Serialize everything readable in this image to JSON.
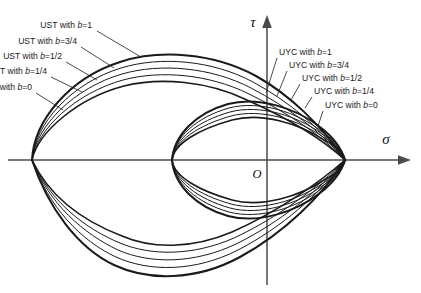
{
  "figure": {
    "background_color": "#ffffff",
    "curve_color": "#1a1a1a",
    "axis_color": "#4a4a4a",
    "leader_color": "#2b2b2b"
  },
  "axes": {
    "x_axis": {
      "label": "σ",
      "name": "sigma-axis",
      "arrow": "right"
    },
    "y_axis": {
      "label": "τ",
      "name": "tau-axis",
      "arrow": "up"
    },
    "origin": {
      "label": "O"
    }
  },
  "chart_data": {
    "type": "line",
    "title": "",
    "subtitle": "",
    "xlabel": "σ",
    "ylabel": "τ",
    "grid": false,
    "legend_position": "inline-callouts",
    "annotations": [
      "UST with b=0",
      "UST with b=1/4",
      "UST with b=1/2",
      "UST with b=3/4",
      "UST with b=1",
      "UYC with b=0",
      "UYC with b=1/4",
      "UYC with b=1/2",
      "UYC with b=3/4",
      "UYC with b=1"
    ],
    "series": [
      {
        "name": "UST with b=0",
        "family": "UST",
        "b": 0
      },
      {
        "name": "UST with b=1/4",
        "family": "UST",
        "b": 0.25
      },
      {
        "name": "UST with b=1/2",
        "family": "UST",
        "b": 0.5
      },
      {
        "name": "UST with b=3/4",
        "family": "UST",
        "b": 0.75
      },
      {
        "name": "UST with b=1",
        "family": "UST",
        "b": 1
      },
      {
        "name": "UYC with b=0",
        "family": "UYC",
        "b": 0
      },
      {
        "name": "UYC with b=1/4",
        "family": "UYC",
        "b": 0.25
      },
      {
        "name": "UYC with b=1/2",
        "family": "UYC",
        "b": 0.5
      },
      {
        "name": "UYC with b=3/4",
        "family": "UYC",
        "b": 0.75
      },
      {
        "name": "UYC with b=1",
        "family": "UYC",
        "b": 1
      }
    ]
  },
  "callouts": {
    "ust": [
      {
        "prefix": "UST with ",
        "var": "b",
        "value": "=1",
        "text_x": 92,
        "text_y": 26,
        "lx1": 97,
        "ly1": 31,
        "lx2": 141,
        "ly2": 57
      },
      {
        "prefix": "UST with ",
        "var": "b",
        "value": "=3/4",
        "text_x": 77,
        "text_y": 42,
        "lx1": 81,
        "ly1": 47,
        "lx2": 114,
        "ly2": 68
      },
      {
        "prefix": "UST with ",
        "var": "b",
        "value": "=1/2",
        "text_x": 62,
        "text_y": 57,
        "lx1": 66,
        "ly1": 62,
        "lx2": 97,
        "ly2": 80
      },
      {
        "prefix": "UST with ",
        "var": "b",
        "value": "=1/4",
        "text_x": 47,
        "text_y": 72,
        "lx1": 51,
        "ly1": 77,
        "lx2": 82,
        "ly2": 92
      },
      {
        "prefix": "UST with ",
        "var": "b",
        "value": "=0",
        "text_x": 32,
        "text_y": 88,
        "lx1": 36,
        "ly1": 93,
        "lx2": 63,
        "ly2": 110
      }
    ],
    "uyc": [
      {
        "prefix": "UYC with ",
        "var": "b",
        "value": "=1",
        "text_x": 279,
        "text_y": 53,
        "lx1": 277,
        "ly1": 58,
        "lx2": 266,
        "ly2": 93
      },
      {
        "prefix": "UYC with ",
        "var": "b",
        "value": "=3/4",
        "text_x": 289,
        "text_y": 66,
        "lx1": 287,
        "ly1": 71,
        "lx2": 277,
        "ly2": 96
      },
      {
        "prefix": "UYC with ",
        "var": "b",
        "value": "=1/2",
        "text_x": 302,
        "text_y": 79,
        "lx1": 300,
        "ly1": 84,
        "lx2": 291,
        "ly2": 100
      },
      {
        "prefix": "UYC with ",
        "var": "b",
        "value": "=1/4",
        "text_x": 314,
        "text_y": 92,
        "lx1": 312,
        "ly1": 97,
        "lx2": 305,
        "ly2": 108
      },
      {
        "prefix": "UYC with ",
        "var": "b",
        "value": "=0",
        "text_x": 325,
        "text_y": 106,
        "lx1": 323,
        "ly1": 111,
        "lx2": 318,
        "ly2": 126
      }
    ]
  }
}
